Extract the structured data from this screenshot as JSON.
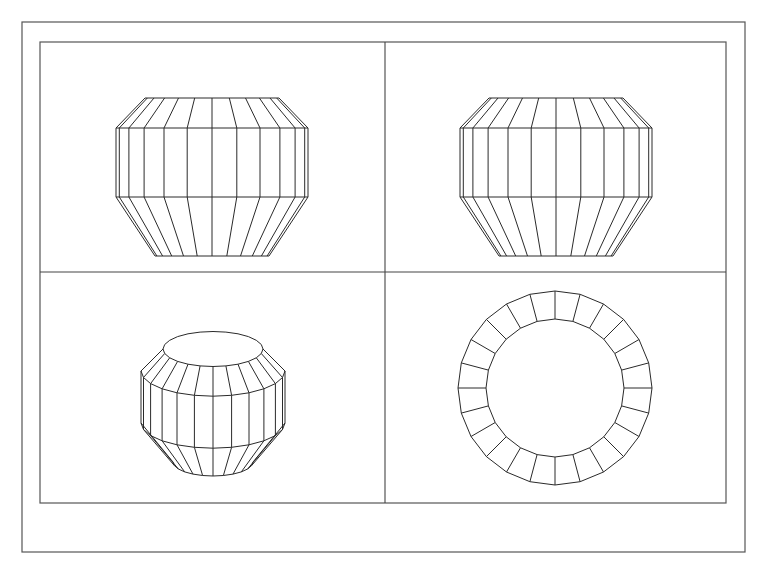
{
  "drawing": {
    "type": "cad-multiview",
    "subject": "faceted barrel / vase solid",
    "segments": 24,
    "colors": {
      "background": "#ffffff",
      "line": "#2a2a2a",
      "frame": "#555555"
    }
  },
  "layout": {
    "outer_frame": {
      "x": 22,
      "y": 22,
      "w": 723,
      "h": 530
    },
    "inner_frame": {
      "x": 40,
      "y": 42,
      "w": 686,
      "h": 461
    },
    "vertical_divider_x": 385,
    "horizontal_divider_y": 272
  },
  "viewports": [
    {
      "name": "front-view",
      "kind": "elevation",
      "cx": 212,
      "levels": [
        {
          "y": 98,
          "r": 67
        },
        {
          "y": 128,
          "r": 96
        },
        {
          "y": 197,
          "r": 96
        },
        {
          "y": 256,
          "r": 57
        }
      ]
    },
    {
      "name": "side-view",
      "kind": "elevation",
      "cx": 556,
      "levels": [
        {
          "y": 98,
          "r": 67
        },
        {
          "y": 128,
          "r": 96
        },
        {
          "y": 197,
          "r": 96
        },
        {
          "y": 256,
          "r": 57
        }
      ]
    },
    {
      "name": "isometric-view",
      "kind": "isometric",
      "cx": 213,
      "tilt": 0.35,
      "levels": [
        {
          "y": 349,
          "r": 50
        },
        {
          "y": 371,
          "r": 72
        },
        {
          "y": 423,
          "r": 72
        },
        {
          "y": 462,
          "r": 40
        }
      ]
    },
    {
      "name": "top-view",
      "kind": "plan",
      "cx": 555,
      "cy": 388,
      "outer_r": 97,
      "inner_r": 69
    }
  ]
}
